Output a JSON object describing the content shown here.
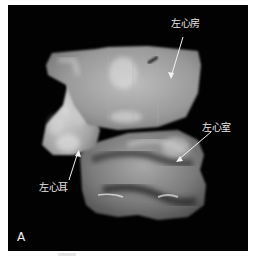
{
  "figure": {
    "panel_letter": "A",
    "background_color": "#020202",
    "structure_color": "#c9c9c9",
    "labels": [
      {
        "id": "left-atrium",
        "text": "左心房"
      },
      {
        "id": "left-ventricle",
        "text": "左心室"
      },
      {
        "id": "left-atrial-appendage",
        "text": "左心耳"
      }
    ]
  }
}
